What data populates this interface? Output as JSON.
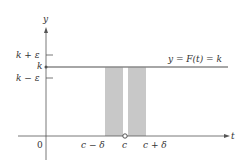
{
  "diagram": {
    "axes": {
      "y_label": "y",
      "x_label": "t",
      "origin_label": "0"
    },
    "y_ticks": [
      {
        "label": "k + ε",
        "role": "upper-epsilon"
      },
      {
        "label": "k",
        "role": "k"
      },
      {
        "label": "k − ε",
        "role": "lower-epsilon"
      }
    ],
    "x_ticks": [
      {
        "label": "c − δ"
      },
      {
        "label": "c"
      },
      {
        "label": "c + δ"
      }
    ],
    "function_label": "y = F(t) = k",
    "colors": {
      "axis": "#555555",
      "line": "#888888",
      "shade": "#c8c8c8",
      "text": "#333333"
    }
  }
}
